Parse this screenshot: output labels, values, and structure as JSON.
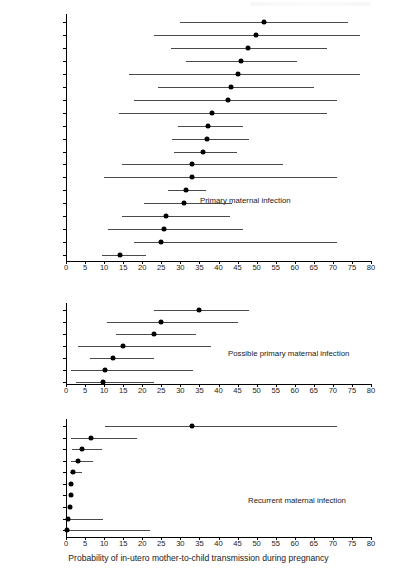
{
  "figure": {
    "xaxis_title": "Probability of in-utero mother-to-child transmission during pregnancy",
    "xlim": [
      0,
      80
    ],
    "xticks": [
      0,
      5,
      10,
      15,
      20,
      25,
      30,
      35,
      40,
      45,
      50,
      55,
      60,
      65,
      70,
      75,
      80
    ]
  },
  "chart_data": {
    "type": "scatter",
    "title": "",
    "xlabel": "Probability of in-utero mother-to-child transmission during pregnancy",
    "ylabel": "",
    "xlim": [
      0,
      80
    ],
    "ylim": [
      0,
      1
    ],
    "grid": false,
    "legend": "none",
    "xticks": [
      0,
      5,
      10,
      15,
      20,
      25,
      30,
      35,
      40,
      45,
      50,
      55,
      60,
      65,
      70,
      75,
      80
    ],
    "panels": [
      {
        "annotation": "Primary maternal infection",
        "rows": [
          {
            "label": "US-Alabama",
            "estimate": 52.0,
            "ci_low": 29.8,
            "ci_high": 74.0
          },
          {
            "label": "US-Ohio",
            "estimate": 49.8,
            "ci_low": 23.0,
            "ci_high": 77.0
          },
          {
            "label": "France",
            "estimate": 47.8,
            "ci_low": 27.5,
            "ci_high": 68.5
          },
          {
            "label": "Italy",
            "estimate": 45.8,
            "ci_low": 31.5,
            "ci_high": 60.5
          },
          {
            "label": "UK",
            "estimate": 45.2,
            "ci_low": 16.5,
            "ci_high": 77.0
          },
          {
            "label": "Italy",
            "estimate": 43.2,
            "ci_low": 24.0,
            "ci_high": 65.0
          },
          {
            "label": "Sweden",
            "estimate": 42.5,
            "ci_low": 17.8,
            "ci_high": 71.2
          },
          {
            "label": "UK",
            "estimate": 38.2,
            "ci_low": 14.0,
            "ci_high": 68.5
          },
          {
            "label": "Germany",
            "estimate": 37.2,
            "ci_low": 29.5,
            "ci_high": 46.5
          },
          {
            "label": "US-Alabama",
            "estimate": 37.0,
            "ci_low": 27.8,
            "ci_high": 48.0
          },
          {
            "label": "Belgium",
            "estimate": 36.0,
            "ci_low": 28.2,
            "ci_high": 44.8
          },
          {
            "label": "US-Texas",
            "estimate": 33.0,
            "ci_low": 14.8,
            "ci_high": 57.0
          },
          {
            "label": "Australia",
            "estimate": 33.0,
            "ci_low": 10.0,
            "ci_high": 71.2
          },
          {
            "label": "Italy",
            "estimate": 31.5,
            "ci_low": 26.8,
            "ci_high": 36.8
          },
          {
            "label": "Switzerland",
            "estimate": 31.0,
            "ci_low": 20.5,
            "ci_high": 43.5
          },
          {
            "label": "Israel",
            "estimate": 26.2,
            "ci_low": 14.8,
            "ci_high": 43.0
          },
          {
            "label": "UK",
            "estimate": 25.8,
            "ci_low": 11.0,
            "ci_high": 46.5
          },
          {
            "label": "Italy",
            "estimate": 25.0,
            "ci_low": 17.8,
            "ci_high": 71.2
          },
          {
            "label": "Germany",
            "estimate": 14.2,
            "ci_low": 9.5,
            "ci_high": 21.0
          }
        ]
      },
      {
        "annotation": "Possible primary maternal infection",
        "rows": [
          {
            "label": "Israel",
            "estimate": 34.8,
            "ci_low": 23.2,
            "ci_high": 48.0
          },
          {
            "label": "UK",
            "estimate": 25.0,
            "ci_low": 10.8,
            "ci_high": 45.0
          },
          {
            "label": "Belgium",
            "estimate": 23.2,
            "ci_low": 13.2,
            "ci_high": 34.0
          },
          {
            "label": "US-Texas",
            "estimate": 15.0,
            "ci_low": 3.2,
            "ci_high": 38.0
          },
          {
            "label": "Iraq",
            "estimate": 12.2,
            "ci_low": 6.2,
            "ci_high": 23.2
          },
          {
            "label": "UK",
            "estimate": 10.2,
            "ci_low": 1.2,
            "ci_high": 33.2
          },
          {
            "label": "France",
            "estimate": 9.8,
            "ci_low": 2.5,
            "ci_high": 23.2
          }
        ]
      },
      {
        "annotation": "Recurrent maternal infection",
        "rows": [
          {
            "label": "Israel",
            "estimate": 33.0,
            "ci_low": 10.2,
            "ci_high": 71.0
          },
          {
            "label": "Italy",
            "estimate": 6.6,
            "ci_low": 1.2,
            "ci_high": 18.5
          },
          {
            "label": "Egypt",
            "estimate": 4.2,
            "ci_low": 1.5,
            "ci_high": 9.5
          },
          {
            "label": "US-Alabama",
            "estimate": 3.2,
            "ci_low": 1.4,
            "ci_high": 7.0
          },
          {
            "label": "Italy",
            "estimate": 1.8,
            "ci_low": 1.0,
            "ci_high": 4.2
          },
          {
            "label": "Ivory Coast",
            "estimate": 1.3,
            "ci_low": 1.0,
            "ci_high": 1.8
          },
          {
            "label": "Sweden",
            "estimate": 1.2,
            "ci_low": 0.9,
            "ci_high": 1.6
          },
          {
            "label": "US-Alabama",
            "estimate": 1.0,
            "ci_low": 0.8,
            "ci_high": 1.4
          },
          {
            "label": "France",
            "estimate": 0.4,
            "ci_low": 0.2,
            "ci_high": 9.8
          },
          {
            "label": "UK",
            "estimate": 0.3,
            "ci_low": 0.1,
            "ci_high": 22.0
          }
        ]
      }
    ]
  }
}
